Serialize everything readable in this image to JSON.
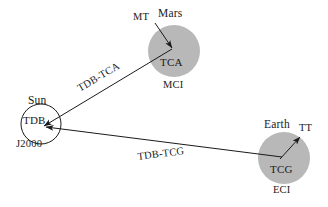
{
  "figure": {
    "type": "diagram",
    "background_color": "#ffffff",
    "body_fill_color": "#b8b8b8",
    "line_color": "#1a1a1a"
  },
  "nodes": {
    "sun": {
      "body_label": "Sun",
      "timescale_label": "TDB",
      "frame_label": "J2000",
      "shape": "open-circle",
      "cx": 41,
      "cy": 124,
      "r": 20
    },
    "mars": {
      "body_label": "Mars",
      "timescale_label": "TCA",
      "frame_label": "MCI",
      "local_time_label": "MT",
      "shape": "filled-circle",
      "cx": 174,
      "cy": 51,
      "r": 26
    },
    "earth": {
      "body_label": "Earth",
      "timescale_label": "TCG",
      "frame_label": "ECI",
      "local_time_label": "TT",
      "shape": "filled-circle",
      "cx": 284,
      "cy": 158,
      "r": 26
    }
  },
  "edges": [
    {
      "id": "mars-to-sun",
      "label": "TDB-TCA",
      "from": "mars",
      "to": "sun",
      "arrow_at": "sun"
    },
    {
      "id": "earth-to-sun",
      "label": "TDB-TCG",
      "from": "earth",
      "to": "sun",
      "arrow_at": "sun"
    },
    {
      "id": "mt-to-tca",
      "label": "MT",
      "from": "mars-surface",
      "to": "mars-center",
      "arrow_at": "mars-center"
    },
    {
      "id": "tcg-to-tt",
      "label": "TT",
      "from": "earth-center",
      "to": "earth-surface",
      "arrow_at": "earth-surface"
    }
  ]
}
